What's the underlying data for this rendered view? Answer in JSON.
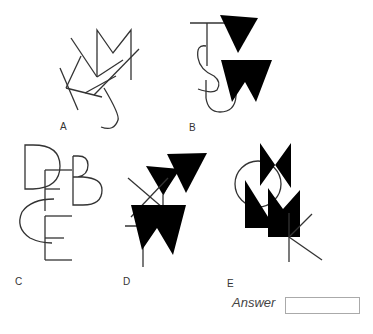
{
  "puzzle": {
    "figures": [
      {
        "label": "A",
        "letters": [
          "K",
          "M",
          "J",
          "Y"
        ]
      },
      {
        "label": "B",
        "letters": [
          "T",
          "V",
          "S",
          "W",
          "U"
        ]
      },
      {
        "label": "C",
        "letters": [
          "D",
          "B",
          "F",
          "C",
          "E"
        ]
      },
      {
        "label": "D",
        "letters": [
          "X",
          "Y",
          "V",
          "T",
          "W"
        ]
      },
      {
        "label": "E",
        "letters": [
          "O",
          "N",
          "L",
          "M",
          "K"
        ]
      }
    ]
  },
  "answer": {
    "label": "Answer",
    "value": ""
  }
}
